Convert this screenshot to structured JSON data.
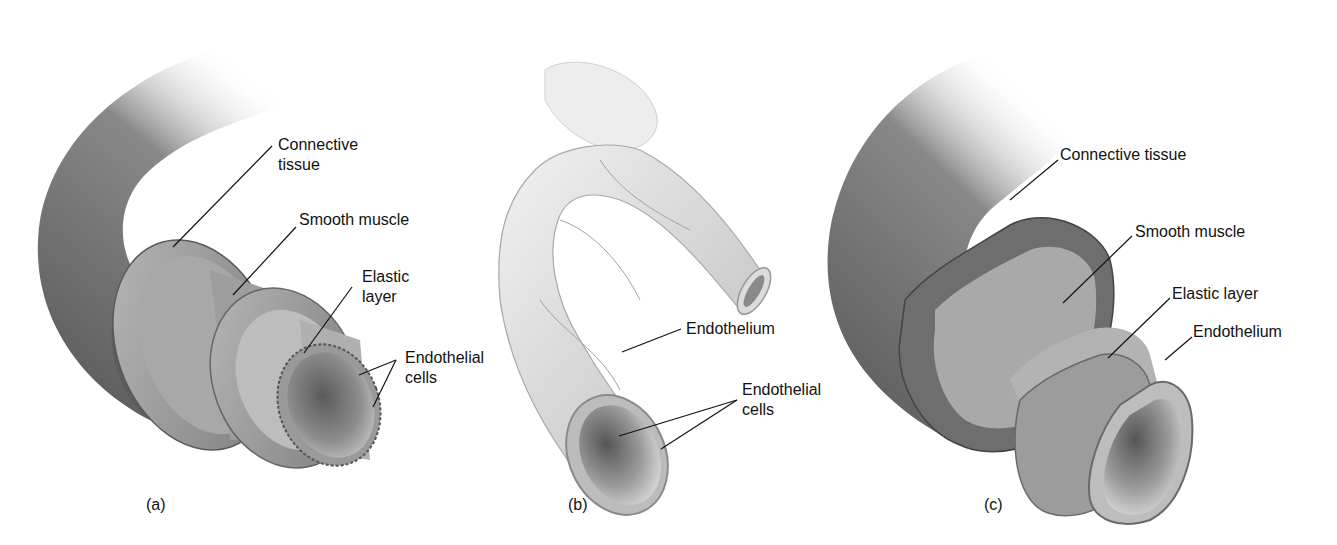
{
  "figure": {
    "panels": [
      {
        "id": "a",
        "caption": "(a)",
        "subject": "artery",
        "labels": [
          {
            "line1": "Connective",
            "line2": "tissue"
          },
          {
            "line1": "Smooth muscle"
          },
          {
            "line1": "Elastic",
            "line2": "layer"
          },
          {
            "line1": "Endothelial",
            "line2": "cells"
          }
        ]
      },
      {
        "id": "b",
        "caption": "(b)",
        "subject": "capillary",
        "labels": [
          {
            "line1": "Endothelium"
          },
          {
            "line1": "Endothelial",
            "line2": "cells"
          }
        ]
      },
      {
        "id": "c",
        "caption": "(c)",
        "subject": "vein",
        "labels": [
          {
            "line1": "Connective tissue"
          },
          {
            "line1": "Smooth muscle"
          },
          {
            "line1": "Elastic layer"
          },
          {
            "line1": "Endothelium"
          }
        ]
      }
    ],
    "colors": {
      "background": "#ffffff",
      "vessel_dark": "#4a4a4a",
      "vessel_mid": "#8a8a8a",
      "vessel_light": "#d9d9d9",
      "label_text": "#111111",
      "leader_line": "#111111"
    }
  }
}
